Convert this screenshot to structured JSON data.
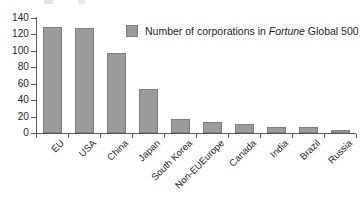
{
  "chart_data": {
    "type": "bar",
    "title": "",
    "subtitle": "",
    "xlabel": "",
    "ylabel": "",
    "ylim": [
      0,
      140
    ],
    "yticks": [
      0,
      20,
      40,
      60,
      80,
      100,
      120,
      140
    ],
    "grid": false,
    "legend_position": "top-center",
    "categories": [
      "EU",
      "USA",
      "China",
      "Japan",
      "South Korea",
      "Non-EUEurope",
      "Canada",
      "India",
      "Brazil",
      "Russia"
    ],
    "values": [
      129,
      128,
      98,
      54,
      17,
      13,
      11,
      7,
      7,
      4
    ],
    "series": [
      {
        "name": "Number of corporations in Fortune Global 500",
        "values": [
          129,
          128,
          98,
          54,
          17,
          13,
          11,
          7,
          7,
          4
        ]
      }
    ],
    "bar_color": "#9b9b9b",
    "bar_border_color": "#7e7e7e",
    "axis_color": "#58595b",
    "text_color": "#231f20"
  },
  "legend": {
    "swatch_name": "legend-swatch-gray",
    "text_before": "Number of corporations in ",
    "text_italic": "Fortune",
    "text_after": " Global 500"
  },
  "axes": {
    "y_tick_labels": [
      "140",
      "120",
      "100",
      "80",
      "60",
      "40",
      "20",
      "0"
    ],
    "x_tick_labels": [
      "EU",
      "USA",
      "China",
      "Japan",
      "South Korea",
      "Non-EUEurope",
      "Canada",
      "India",
      "Brazil",
      "Russia"
    ]
  }
}
